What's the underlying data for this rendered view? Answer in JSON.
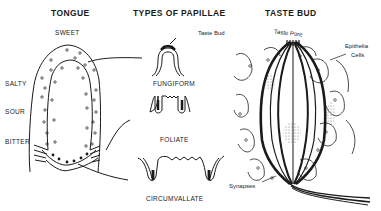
{
  "diagram": {
    "sections": [
      {
        "title": "TONGUE",
        "regions": [
          "SWEET",
          "SALTY",
          "SOUR",
          "BITTER"
        ]
      },
      {
        "title": "TYPES OF PAPILLAE",
        "types": [
          "FUNGIFORM",
          "FOLIATE",
          "CIRCUMVALLATE"
        ],
        "annotation": "Taste Bud"
      },
      {
        "title": "TASTE BUD",
        "annotations": [
          "Taste Pore",
          "Epithelia Cells",
          "Synapses"
        ]
      }
    ]
  },
  "labels": {
    "tongue_title": "TONGUE",
    "sweet": "SWEET",
    "salty": "SALTY",
    "sour": "SOUR",
    "bitter": "BITTER",
    "papillae_title": "TYPES OF PAPILLAE",
    "taste_bud_label": "Taste Bud",
    "fungiform": "FUNGIFORM",
    "foliate": "FOLIATE",
    "circumvallate": "CIRCUMVALLATE",
    "tastebud_title": "TASTE BUD",
    "taste_pore": "Taste Pore",
    "epithelia_line1": "Epithelia",
    "epithelia_line2": "Cells",
    "synapses": "Synapses"
  },
  "colors": {
    "ink": "#1a1a1a",
    "background": "#ffffff",
    "stipple": "#9a9a9a"
  }
}
